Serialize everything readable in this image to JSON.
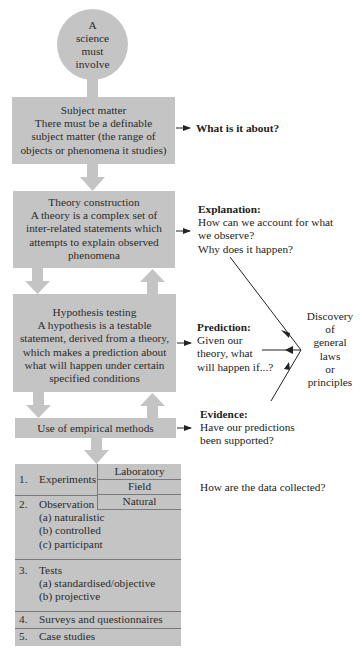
{
  "colors": {
    "box_fill": "#c4c4c4",
    "text": "#2b2b2b",
    "line": "#222222",
    "divider": "#7a7a7a"
  },
  "start": {
    "lines": [
      "A",
      "science",
      "must",
      "involve"
    ]
  },
  "boxes": {
    "subject": {
      "title": "Subject matter",
      "lines": [
        "There must be a definable",
        "subject matter (the range of",
        "objects or phenomena it studies)"
      ]
    },
    "theory": {
      "title": "Theory construction",
      "lines": [
        "A theory is a complex set of",
        "inter-related statements which",
        "attempts to explain observed",
        "phenomena"
      ]
    },
    "hypothesis": {
      "title": "Hypothesis testing",
      "lines": [
        "A hypothesis is a testable",
        "statement, derived from a theory,",
        "which makes a prediction about",
        "what will happen under certain",
        "specified conditions"
      ]
    },
    "empirical": {
      "title": "Use of empirical methods"
    }
  },
  "side_notes": {
    "subject": {
      "heading": "What is it about?"
    },
    "explanation": {
      "heading": "Explanation:",
      "lines": [
        "How can we account for what",
        "we observe?",
        "Why does it happen?"
      ]
    },
    "prediction": {
      "heading": "Prediction:",
      "lines": [
        "Given our",
        "theory, what",
        "will happen if...?"
      ]
    },
    "evidence": {
      "heading": "Evidence:",
      "lines": [
        "Have our predictions",
        "been supported?"
      ]
    },
    "discovery": {
      "lines": [
        "Discovery",
        "of",
        "general",
        "laws",
        "or",
        "principles"
      ]
    },
    "data_collection": {
      "text": "How are the data collected?"
    }
  },
  "methods": {
    "experiments": {
      "number": "1.",
      "label": "Experiments",
      "types": [
        "Laboratory",
        "Field",
        "Natural"
      ]
    },
    "observation": {
      "number": "2.",
      "label": "Observation",
      "subs": [
        "(a) naturalistic",
        "(b) controlled",
        "(c) participant"
      ]
    },
    "tests": {
      "number": "3.",
      "label": "Tests",
      "subs": [
        "(a) standardised/objective",
        "(b) projective"
      ]
    },
    "surveys": {
      "number": "4.",
      "label": "Surveys and questionnaires"
    },
    "case_studies": {
      "number": "5.",
      "label": "Case studies"
    }
  }
}
